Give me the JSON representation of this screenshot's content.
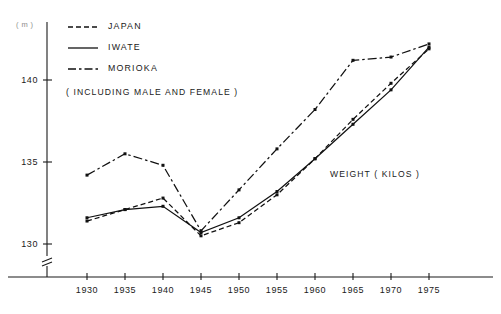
{
  "chart_data": {
    "type": "line",
    "title": "",
    "xlabel": "",
    "ylabel": "",
    "unit_label": "( m )",
    "annotations": [
      {
        "name": "inclusion-note",
        "text": "( INCLUDING  MALE  AND  FEMALE )"
      },
      {
        "name": "weight-units-note",
        "text": "WEIGHT ( KILOS )"
      }
    ],
    "categories": [
      1930,
      1935,
      1940,
      1945,
      1950,
      1955,
      1960,
      1965,
      1970,
      1975
    ],
    "x": [
      "1930",
      "1935",
      "1940",
      "1945",
      "1950",
      "1955",
      "1960",
      "1965",
      "1970",
      "1975"
    ],
    "xlim": [
      1927.5,
      1977.5
    ],
    "ylim": [
      129.0,
      142.8
    ],
    "yticks": [
      130,
      135,
      140
    ],
    "ytick_labels": [
      "130",
      "135",
      "140"
    ],
    "grid": false,
    "axis_break": true,
    "legend_position": "top-left",
    "series": [
      {
        "name": "JAPAN",
        "style": "dashed",
        "values": [
          131.4,
          132.1,
          132.8,
          130.5,
          131.3,
          133.0,
          135.2,
          137.6,
          139.8,
          141.9
        ]
      },
      {
        "name": "IWATE",
        "style": "solid",
        "values": [
          131.6,
          132.1,
          132.3,
          130.7,
          131.6,
          133.2,
          135.2,
          137.3,
          139.4,
          142.0
        ]
      },
      {
        "name": "MORIOKA",
        "style": "dash-dot",
        "values": [
          134.2,
          135.5,
          134.8,
          130.8,
          133.3,
          135.8,
          138.2,
          141.2,
          141.4,
          142.2
        ]
      }
    ]
  },
  "legend": {
    "items": [
      {
        "label": "JAPAN",
        "style": "dashed"
      },
      {
        "label": "IWATE",
        "style": "solid"
      },
      {
        "label": "MORIOKA",
        "style": "dash-dot"
      }
    ]
  },
  "colors": {
    "ink": "#111111",
    "axis": "#1a1a1a",
    "unit_text": "#8d8d8d",
    "background": "#ffffff"
  }
}
